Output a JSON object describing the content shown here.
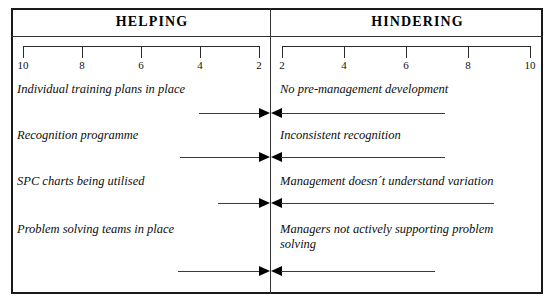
{
  "diagram": {
    "type": "force-field-analysis",
    "columns": {
      "helping": "HELPING",
      "hindering": "HINDERING"
    },
    "scale": {
      "left_ticks": [
        "10",
        "8",
        "6",
        "4",
        "2"
      ],
      "right_ticks": [
        "2",
        "4",
        "6",
        "8",
        "10"
      ],
      "max": 10,
      "step": 2
    },
    "rows": [
      {
        "helping_label": "Individual training plans in place",
        "hindering_label": "No pre-management development",
        "helping_force": 3.0,
        "hindering_force": 7.0
      },
      {
        "helping_label": "Recognition programme",
        "hindering_label": "Inconsistent recognition",
        "helping_force": 3.8,
        "hindering_force": 7.0
      },
      {
        "helping_label": "SPC charts being utilised",
        "hindering_label": "Management doesn´t understand variation",
        "helping_force": 2.2,
        "hindering_force": 9.0
      },
      {
        "helping_label": "Problem solving teams in place",
        "hindering_label": "Managers not actively supporting problem\nsolving",
        "helping_force": 3.9,
        "hindering_force": 6.6
      }
    ]
  },
  "chart_data": {
    "type": "bar",
    "xlabel": "",
    "ylabel": "",
    "categories": [
      "Individual training plans in place / No pre-management development",
      "Recognition programme / Inconsistent recognition",
      "SPC charts being utilised / Management doesn´t understand variation",
      "Problem solving teams in place / Managers not actively supporting problem solving"
    ],
    "series": [
      {
        "name": "HELPING",
        "direction": "left-to-center",
        "labels": [
          "Individual training plans in place",
          "Recognition programme",
          "SPC charts being utilised",
          "Problem solving teams in place"
        ],
        "values": [
          3.0,
          3.8,
          2.2,
          3.9
        ]
      },
      {
        "name": "HINDERING",
        "direction": "right-to-center",
        "labels": [
          "No pre-management development",
          "Inconsistent recognition",
          "Management doesn´t understand variation",
          "Managers not actively supporting problem solving"
        ],
        "values": [
          7.0,
          7.0,
          9.0,
          6.6
        ]
      }
    ],
    "xlim": [
      0,
      10
    ],
    "grid": false,
    "legend": "top",
    "axis_tick_labels_left": [
      "10",
      "8",
      "6",
      "4",
      "2"
    ],
    "axis_tick_labels_right": [
      "2",
      "4",
      "6",
      "8",
      "10"
    ]
  }
}
